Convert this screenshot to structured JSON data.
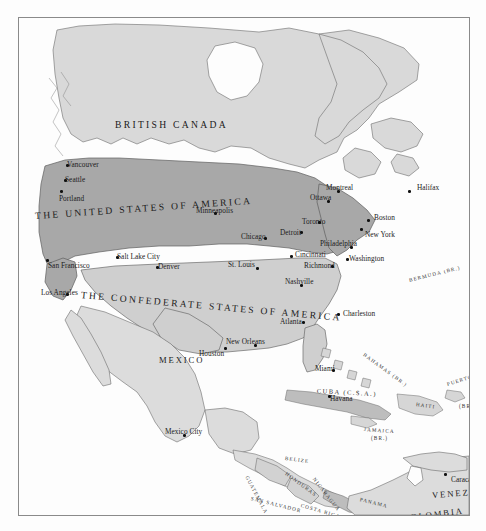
{
  "map": {
    "title": "Alternate History Map of North America",
    "frame": {
      "border_color": "#8a8a8a",
      "background": "#fcfcfc"
    },
    "palette": {
      "ocean": "#fdfdfd",
      "united_states_fill": "#a8a8a8",
      "confederate_fill": "#cfcfcf",
      "canada_fill": "#d9d9d9",
      "mexico_fill": "#dcdcdc",
      "neutral_fill": "#e2e2e2",
      "coastline": "#6b6b6b",
      "text": "#1b1b1b"
    },
    "nations": [
      {
        "name": "BRITISH CANADA",
        "style": "nation-big",
        "x": 96,
        "y": 101,
        "rotate": 0,
        "fill": "canada_fill"
      },
      {
        "name": "THE UNITED STATES OF AMERICA",
        "style": "nation-big",
        "x": 16,
        "y": 192,
        "rotate": -4,
        "fill": "united_states_fill"
      },
      {
        "name": "THE CONFEDERATE STATES OF AMERICA",
        "style": "nation-big",
        "x": 62,
        "y": 271,
        "rotate": 5,
        "fill": "confederate_fill"
      },
      {
        "name": "MEXICO",
        "style": "country",
        "x": 140,
        "y": 337,
        "rotate": 0,
        "fill": "mexico_fill"
      },
      {
        "name": "COLOMBIA",
        "style": "country",
        "x": 384,
        "y": 495,
        "rotate": -7,
        "fill": "neutral_fill"
      },
      {
        "name": "VENEZUELA",
        "style": "country",
        "x": 413,
        "y": 472,
        "rotate": -4,
        "fill": "neutral_fill"
      }
    ],
    "territories": [
      {
        "name": "BERMUDA (BR.)",
        "style": "country-xs",
        "x": 390,
        "y": 259,
        "rotate": -14
      },
      {
        "name": "BAHAMAS (BR.)",
        "style": "country-xs",
        "x": 345,
        "y": 333,
        "rotate": 36
      },
      {
        "name": "CUBA (C.S.A.)",
        "style": "country-sm",
        "x": 298,
        "y": 369,
        "rotate": 3
      },
      {
        "name": "HAITI",
        "style": "country-xs",
        "x": 397,
        "y": 383,
        "rotate": 8
      },
      {
        "name": "PUERTO RICO",
        "style": "country-xs",
        "x": 428,
        "y": 363,
        "rotate": -17
      },
      {
        "name": "(BR.)",
        "style": "country-xs",
        "x": 440,
        "y": 385,
        "rotate": 0
      },
      {
        "name": "JAMAICA",
        "style": "country-xs",
        "x": 345,
        "y": 408,
        "rotate": 4
      },
      {
        "name": "(BR.)",
        "style": "country-xs",
        "x": 352,
        "y": 417,
        "rotate": 0
      },
      {
        "name": "BELIZE",
        "style": "country-xs",
        "x": 266,
        "y": 437,
        "rotate": 7
      },
      {
        "name": "GUATEMALA",
        "style": "country-xs",
        "x": 228,
        "y": 455,
        "rotate": 62
      },
      {
        "name": "HONDURAS",
        "style": "country-xs",
        "x": 267,
        "y": 452,
        "rotate": 36
      },
      {
        "name": "NICARAGUA",
        "style": "country-xs",
        "x": 295,
        "y": 457,
        "rotate": 52
      },
      {
        "name": "SAN SALVADOR",
        "style": "country-xs",
        "x": 232,
        "y": 477,
        "rotate": 14
      },
      {
        "name": "COSTA RICA",
        "style": "country-xs",
        "x": 282,
        "y": 484,
        "rotate": 16
      },
      {
        "name": "PANAMA",
        "style": "country-xs",
        "x": 341,
        "y": 478,
        "rotate": 14
      }
    ],
    "cities": [
      {
        "name": "Vancouver",
        "x": 48,
        "y": 143,
        "anchor": "left"
      },
      {
        "name": "Seattle",
        "x": 46,
        "y": 158,
        "anchor": "left"
      },
      {
        "name": "Portland",
        "x": 40,
        "y": 177,
        "anchor": "left"
      },
      {
        "name": "San Francisco",
        "x": 29,
        "y": 244,
        "anchor": "left"
      },
      {
        "name": "Los Angeles",
        "x": 22,
        "y": 271,
        "anchor": "left"
      },
      {
        "name": "Salt Lake City",
        "x": 98,
        "y": 235,
        "anchor": "left"
      },
      {
        "name": "Denver",
        "x": 139,
        "y": 245,
        "anchor": "left"
      },
      {
        "name": "Minneapolis",
        "x": 177,
        "y": 189,
        "anchor": "left"
      },
      {
        "name": "Chicago",
        "x": 222,
        "y": 215,
        "anchor": "left"
      },
      {
        "name": "St. Louis",
        "x": 209,
        "y": 243,
        "anchor": "left"
      },
      {
        "name": "Detroit",
        "x": 261,
        "y": 211,
        "anchor": "left"
      },
      {
        "name": "Toronto",
        "x": 283,
        "y": 200,
        "anchor": "left"
      },
      {
        "name": "Ottawa",
        "x": 291,
        "y": 176,
        "anchor": "left"
      },
      {
        "name": "Montreal",
        "x": 307,
        "y": 166,
        "anchor": "left"
      },
      {
        "name": "Halifax",
        "x": 398,
        "y": 166,
        "anchor": "left"
      },
      {
        "name": "Boston",
        "x": 355,
        "y": 196,
        "anchor": "left"
      },
      {
        "name": "New York",
        "x": 346,
        "y": 213,
        "anchor": "left"
      },
      {
        "name": "Philadelphia",
        "x": 301,
        "y": 222,
        "anchor": "left"
      },
      {
        "name": "Washington",
        "x": 330,
        "y": 237,
        "anchor": "left"
      },
      {
        "name": "Cincinnati",
        "x": 276,
        "y": 233,
        "anchor": "left"
      },
      {
        "name": "Richmond",
        "x": 285,
        "y": 244,
        "anchor": "left"
      },
      {
        "name": "Nashville",
        "x": 266,
        "y": 260,
        "anchor": "left"
      },
      {
        "name": "Charleston",
        "x": 324,
        "y": 292,
        "anchor": "left"
      },
      {
        "name": "Atlanta",
        "x": 261,
        "y": 300,
        "anchor": "left"
      },
      {
        "name": "New Orleans",
        "x": 207,
        "y": 320,
        "anchor": "left"
      },
      {
        "name": "Houston",
        "x": 180,
        "y": 332,
        "anchor": "left"
      },
      {
        "name": "Miami",
        "x": 296,
        "y": 347,
        "anchor": "left"
      },
      {
        "name": "Havana",
        "x": 311,
        "y": 377,
        "anchor": "left"
      },
      {
        "name": "Mexico City",
        "x": 146,
        "y": 410,
        "anchor": "left"
      },
      {
        "name": "Caracas",
        "x": 432,
        "y": 458,
        "anchor": "left"
      }
    ],
    "city_dots": [
      {
        "x": 47,
        "y": 146
      },
      {
        "x": 45,
        "y": 161
      },
      {
        "x": 41,
        "y": 172
      },
      {
        "x": 27,
        "y": 241
      },
      {
        "x": 47,
        "y": 275
      },
      {
        "x": 97,
        "y": 238
      },
      {
        "x": 137,
        "y": 248
      },
      {
        "x": 195,
        "y": 194
      },
      {
        "x": 245,
        "y": 219
      },
      {
        "x": 237,
        "y": 249
      },
      {
        "x": 281,
        "y": 213
      },
      {
        "x": 299,
        "y": 203
      },
      {
        "x": 308,
        "y": 182
      },
      {
        "x": 318,
        "y": 172
      },
      {
        "x": 389,
        "y": 172
      },
      {
        "x": 348,
        "y": 201
      },
      {
        "x": 341,
        "y": 210
      },
      {
        "x": 331,
        "y": 228
      },
      {
        "x": 327,
        "y": 240
      },
      {
        "x": 271,
        "y": 237
      },
      {
        "x": 312,
        "y": 247
      },
      {
        "x": 281,
        "y": 266
      },
      {
        "x": 318,
        "y": 295
      },
      {
        "x": 283,
        "y": 303
      },
      {
        "x": 235,
        "y": 326
      },
      {
        "x": 205,
        "y": 329
      },
      {
        "x": 313,
        "y": 351
      },
      {
        "x": 309,
        "y": 377
      },
      {
        "x": 164,
        "y": 416
      },
      {
        "x": 425,
        "y": 455
      }
    ]
  }
}
